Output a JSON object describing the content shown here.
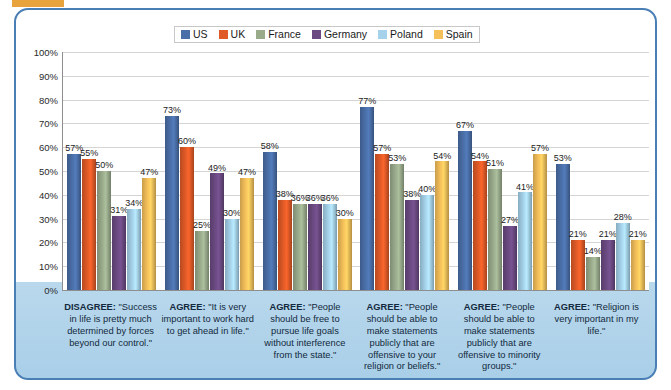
{
  "decor": {
    "tab_color": "#e8a33d",
    "frame_border_color": "#4a7fb5"
  },
  "legend": {
    "position": "top-center",
    "items": [
      {
        "label": "US",
        "color": "#4a6fa8"
      },
      {
        "label": "UK",
        "color": "#e05a27"
      },
      {
        "label": "France",
        "color": "#9aab8c"
      },
      {
        "label": "Germany",
        "color": "#6b4a82"
      },
      {
        "label": "Poland",
        "color": "#a5d2ea"
      },
      {
        "label": "Spain",
        "color": "#f5c05a"
      }
    ]
  },
  "yaxis": {
    "ticks": [
      "0%",
      "10%",
      "20%",
      "30%",
      "40%",
      "50%",
      "60%",
      "70%",
      "80%",
      "90%",
      "100%"
    ]
  },
  "chart_data": {
    "type": "bar",
    "title": "",
    "subtitle": "",
    "xlabel": "",
    "ylabel": "",
    "ylim": [
      0,
      100
    ],
    "grid": true,
    "legend_position": "top-center",
    "categories": [
      "DISAGREE: \"Success in life is pretty much determined by forces beyond our control.\"",
      "AGREE: \"It is very important to work hard to get ahead in life.\"",
      "AGREE: \"People should be free to pursue life goals without interference from the state.\"",
      "AGREE: \"People should be able to make statements publicly that are offensive to your religion or beliefs.\"",
      "AGREE: \"People should be able to make statements publicly that are offensive to minority groups.\"",
      "AGREE: \"Religion is very important in my life.\""
    ],
    "category_prefixes": [
      "DISAGREE:",
      "AGREE:",
      "AGREE:",
      "AGREE:",
      "AGREE:",
      "AGREE:"
    ],
    "category_bodies": [
      "\"Success in life is pretty much determined by forces beyond our control.\"",
      "\"It is very important to work hard to get ahead in life.\"",
      "\"People should be free to pursue life goals without interference from the state.\"",
      "\"People should be able to make statements publicly that are offensive to your religion or beliefs.\"",
      "\"People should be able to make statements publicly that are offensive to minority groups.\"",
      "\"Religion is very important in my life.\""
    ],
    "series": [
      {
        "name": "US",
        "color": "#4a6fa8",
        "values": [
          57,
          73,
          58,
          77,
          67,
          53
        ]
      },
      {
        "name": "UK",
        "color": "#e05a27",
        "values": [
          55,
          60,
          38,
          57,
          54,
          21
        ]
      },
      {
        "name": "France",
        "color": "#9aab8c",
        "values": [
          50,
          25,
          36,
          53,
          51,
          14
        ]
      },
      {
        "name": "Germany",
        "color": "#6b4a82",
        "values": [
          31,
          49,
          36,
          38,
          27,
          21
        ]
      },
      {
        "name": "Poland",
        "color": "#a5d2ea",
        "values": [
          34,
          30,
          36,
          40,
          41,
          28
        ]
      },
      {
        "name": "Spain",
        "color": "#f5c05a",
        "values": [
          47,
          47,
          30,
          54,
          57,
          21
        ]
      }
    ],
    "value_labels": [
      [
        "57%",
        "55%",
        "50%",
        "31%",
        "34%",
        "47%"
      ],
      [
        "73%",
        "60%",
        "25%",
        "49%",
        "30%",
        "47%"
      ],
      [
        "58%",
        "38%",
        "36%",
        "36%",
        "36%",
        "30%"
      ],
      [
        "77%",
        "57%",
        "53%",
        "38%",
        "40%",
        "54%"
      ],
      [
        "67%",
        "54%",
        "51%",
        "27%",
        "41%",
        "57%"
      ],
      [
        "53%",
        "21%",
        "14%",
        "21%",
        "28%",
        "21%"
      ]
    ]
  }
}
